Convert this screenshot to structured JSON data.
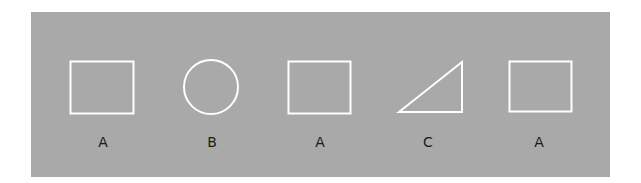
{
  "diagram": {
    "background_color": "#a9a9a9",
    "stroke_color": "#ffffff",
    "figures": [
      {
        "shape": "square",
        "label": "A"
      },
      {
        "shape": "circle",
        "label": "B"
      },
      {
        "shape": "square",
        "label": "A"
      },
      {
        "shape": "right-triangle",
        "label": "C"
      },
      {
        "shape": "square",
        "label": "A"
      }
    ]
  }
}
